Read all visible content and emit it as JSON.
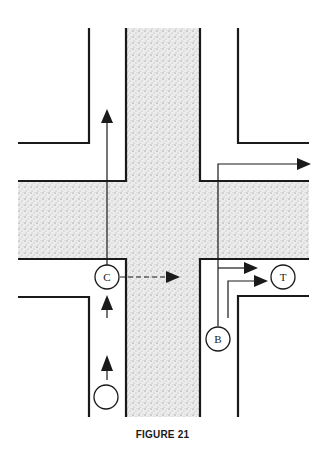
{
  "figure": {
    "caption": "FIGURE 21",
    "type": "intersection-traffic-diagram"
  },
  "vehicles": {
    "c": {
      "label": "C"
    },
    "t": {
      "label": "T"
    },
    "b": {
      "label": "B"
    },
    "unlabeled": {
      "label": ""
    }
  },
  "colors": {
    "line": "#1a1a1a",
    "road_fill": "#d9d9d9",
    "background": "#ffffff"
  }
}
